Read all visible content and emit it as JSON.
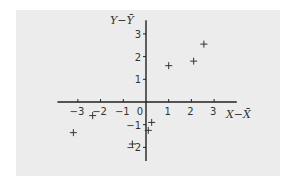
{
  "chart_data": {
    "type": "scatter",
    "title": "",
    "xlabel": "X−X̄",
    "ylabel": "Y−Ȳ",
    "xlim": [
      -3.9,
      4.0
    ],
    "ylim": [
      -2.6,
      3.6
    ],
    "grid": false,
    "legend": null,
    "marker": "+",
    "x_ticks": [
      -3,
      -2,
      -1,
      0,
      1,
      2,
      3
    ],
    "y_ticks": [
      -2,
      -1,
      1,
      2,
      3
    ],
    "x_tick_labels": [
      "−3",
      "−2",
      "−1",
      "0",
      "1",
      "2",
      "3"
    ],
    "y_tick_labels": [
      "−2",
      "−1",
      "1",
      "2",
      "3"
    ],
    "points": [
      {
        "x": -3.2,
        "y": -1.35
      },
      {
        "x": -2.35,
        "y": -0.6
      },
      {
        "x": -0.6,
        "y": -1.85
      },
      {
        "x": 0.1,
        "y": -1.25
      },
      {
        "x": 0.25,
        "y": -0.9
      },
      {
        "x": 1.0,
        "y": 1.6
      },
      {
        "x": 2.1,
        "y": 1.8
      },
      {
        "x": 2.55,
        "y": 2.55
      }
    ]
  },
  "colors": {
    "panel_background": "#ececec",
    "axis": "#222222",
    "marker": "#333333",
    "text": "#333333"
  }
}
